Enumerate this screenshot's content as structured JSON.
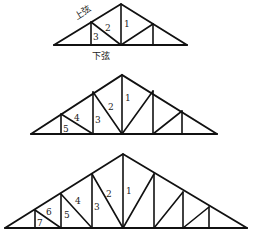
{
  "diagram": {
    "title": "",
    "colors": {
      "line": "#111111",
      "text": "#222222",
      "background": "#ffffff"
    },
    "labels": {
      "top_chord": "上弦",
      "bottom_chord": "下弦"
    },
    "trusses": [
      {
        "id": "truss-small",
        "panels_per_side": 2,
        "member_numbers": [
          "1",
          "2",
          "3"
        ]
      },
      {
        "id": "truss-medium",
        "panels_per_side": 3,
        "member_numbers": [
          "1",
          "2",
          "3",
          "4",
          "5"
        ]
      },
      {
        "id": "truss-large",
        "panels_per_side": 4,
        "member_numbers": [
          "1",
          "2",
          "3",
          "4",
          "5",
          "6",
          "7"
        ]
      }
    ]
  }
}
